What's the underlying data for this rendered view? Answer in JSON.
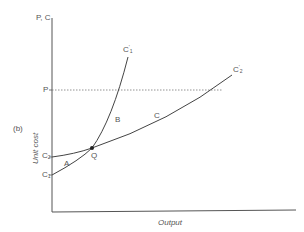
{
  "figure": {
    "panel_label": "(b)",
    "y_axis_top_label": "P, C",
    "y_axis_title": "Unit cost",
    "x_axis_title": "Output",
    "price_level_label": "P",
    "intercepts": {
      "c2": {
        "base": "C",
        "sub": "2"
      },
      "c1": {
        "base": "C",
        "sub": "1"
      }
    },
    "curves": {
      "c1_prime": {
        "base": "C",
        "sup": "'",
        "sub": "1"
      },
      "c2_prime": {
        "base": "C",
        "sup": "'",
        "sub": "2"
      }
    },
    "regions": {
      "a": "A",
      "b": "B",
      "c": "C"
    },
    "intersection_label": "Q",
    "colors": {
      "axis": "#555555",
      "curve": "#444444",
      "dotted": "#777777",
      "text": "#555555"
    }
  }
}
